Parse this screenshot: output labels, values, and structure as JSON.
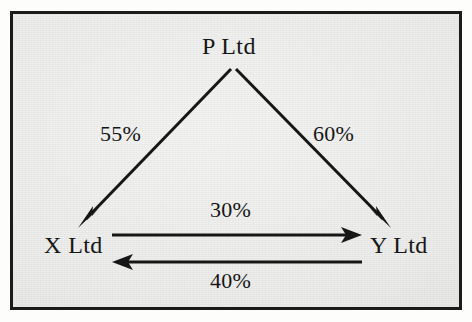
{
  "figure": {
    "type": "ownership-structure-diagram",
    "background_color": "#e9e9e7",
    "border_color": "#1b1b1b",
    "ink_color": "#161616"
  },
  "nodes": [
    {
      "id": "p",
      "label": "P Ltd",
      "role": "parent",
      "x": 233,
      "y": 45
    },
    {
      "id": "x",
      "label": "X Ltd",
      "role": "subsidiary",
      "x": 72,
      "y": 244
    },
    {
      "id": "y",
      "label": "Y Ltd",
      "role": "subsidiary",
      "x": 396,
      "y": 244
    }
  ],
  "edges": [
    {
      "id": "p-to-x",
      "from": "P Ltd",
      "to": "X Ltd",
      "label": "55%",
      "value": 55,
      "unit": "%",
      "direction": "down-left",
      "arrowhead": "end"
    },
    {
      "id": "p-to-y",
      "from": "P Ltd",
      "to": "Y Ltd",
      "label": "60%",
      "value": 60,
      "unit": "%",
      "direction": "down-right",
      "arrowhead": "end"
    },
    {
      "id": "x-to-y",
      "from": "X Ltd",
      "to": "Y Ltd",
      "label": "30%",
      "value": 30,
      "unit": "%",
      "direction": "right",
      "arrowhead": "end"
    },
    {
      "id": "y-to-x",
      "from": "Y Ltd",
      "to": "X Ltd",
      "label": "40%",
      "value": 40,
      "unit": "%",
      "direction": "left",
      "arrowhead": "end"
    }
  ]
}
